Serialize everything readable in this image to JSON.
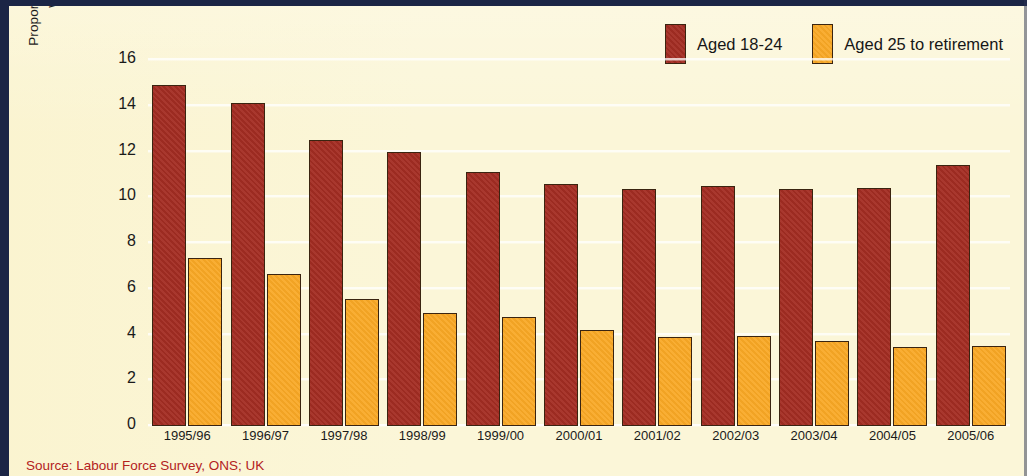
{
  "chart_data": {
    "type": "bar",
    "title": "",
    "xlabel": "",
    "ylabel": "Proportion of the economically active population who are ILO unemployed (per cent)",
    "ylabel_line1": "Proportion of the economically active population",
    "ylabel_line2": "who are ILO unemployed (per cent)",
    "ylim": [
      0,
      17.05
    ],
    "yticks": [
      16,
      14,
      12,
      10,
      8,
      6,
      4,
      2,
      0
    ],
    "grid": true,
    "legend_position": "top-right",
    "categories": [
      "1995/96",
      "1996/97",
      "1997/98",
      "1998/99",
      "1999/00",
      "2000/01",
      "2001/02",
      "2002/03",
      "2003/04",
      "2004/05",
      "2005/06"
    ],
    "series": [
      {
        "name": "Aged 18-24",
        "color": "#a42d23",
        "values": [
          14.9,
          14.1,
          12.5,
          12.0,
          11.1,
          10.6,
          10.35,
          10.5,
          10.35,
          10.4,
          11.4
        ]
      },
      {
        "name": "Aged 25 to retirement",
        "color": "#f9a825",
        "values": [
          7.35,
          6.65,
          5.55,
          4.95,
          4.75,
          4.2,
          3.9,
          3.95,
          3.7,
          3.45,
          3.5
        ]
      }
    ]
  },
  "legend": {
    "items": [
      {
        "label": "Aged 18-24",
        "color": "#a42d23"
      },
      {
        "label": "Aged 25 to retirement",
        "color": "#f9a825"
      }
    ]
  },
  "source": {
    "text": "Source: Labour Force Survey, ONS; UK",
    "color": "#b3221d"
  },
  "colors": {
    "background": "#fbf6d8",
    "frame": "#1b2545",
    "series_1": "#a42d23",
    "series_2": "#f9a825",
    "gridline": "#ffffff",
    "text": "#1a1a1a"
  }
}
